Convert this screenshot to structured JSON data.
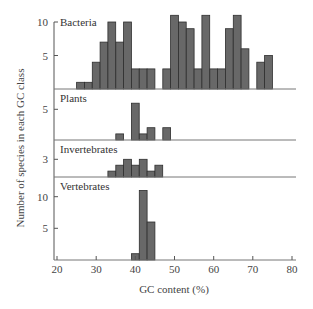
{
  "chart_data": {
    "type": "bar",
    "title": "",
    "xlabel": "GC content (%)",
    "ylabel": "Number of species in each GC class",
    "xlim": [
      19,
      81
    ],
    "x_ticks": [
      20,
      30,
      40,
      50,
      60,
      70,
      80
    ],
    "bin_width": 2,
    "grid": false,
    "legend": null,
    "panels": [
      {
        "name": "Bacteria",
        "y_ticks": [
          5,
          10
        ],
        "bins": [
          {
            "start": 25,
            "value": 1
          },
          {
            "start": 27,
            "value": 1
          },
          {
            "start": 29,
            "value": 4
          },
          {
            "start": 31,
            "value": 7
          },
          {
            "start": 33,
            "value": 10
          },
          {
            "start": 35,
            "value": 7
          },
          {
            "start": 37,
            "value": 10
          },
          {
            "start": 39,
            "value": 3
          },
          {
            "start": 41,
            "value": 3
          },
          {
            "start": 43,
            "value": 3
          },
          {
            "start": 47,
            "value": 3
          },
          {
            "start": 49,
            "value": 11
          },
          {
            "start": 51,
            "value": 10
          },
          {
            "start": 53,
            "value": 9
          },
          {
            "start": 55,
            "value": 3
          },
          {
            "start": 57,
            "value": 11
          },
          {
            "start": 59,
            "value": 3
          },
          {
            "start": 61,
            "value": 3
          },
          {
            "start": 63,
            "value": 9
          },
          {
            "start": 65,
            "value": 11
          },
          {
            "start": 67,
            "value": 6
          },
          {
            "start": 71,
            "value": 4
          },
          {
            "start": 73,
            "value": 5
          }
        ]
      },
      {
        "name": "Plants",
        "y_ticks": [
          5
        ],
        "bins": [
          {
            "start": 35,
            "value": 1
          },
          {
            "start": 39,
            "value": 6
          },
          {
            "start": 41,
            "value": 1
          },
          {
            "start": 43,
            "value": 2
          },
          {
            "start": 47,
            "value": 2
          }
        ]
      },
      {
        "name": "Invertebrates",
        "y_ticks": [
          3
        ],
        "bins": [
          {
            "start": 33,
            "value": 1
          },
          {
            "start": 35,
            "value": 2
          },
          {
            "start": 37,
            "value": 3
          },
          {
            "start": 39,
            "value": 2
          },
          {
            "start": 41,
            "value": 3
          },
          {
            "start": 43,
            "value": 1
          },
          {
            "start": 45,
            "value": 2
          }
        ]
      },
      {
        "name": "Vertebrates",
        "y_ticks": [
          5,
          10
        ],
        "bins": [
          {
            "start": 39,
            "value": 1
          },
          {
            "start": 41,
            "value": 11
          },
          {
            "start": 43,
            "value": 6
          }
        ]
      }
    ]
  },
  "colors": {
    "bar_fill": "#686868",
    "bar_stroke": "#2e2e2e",
    "axis": "#555555"
  }
}
